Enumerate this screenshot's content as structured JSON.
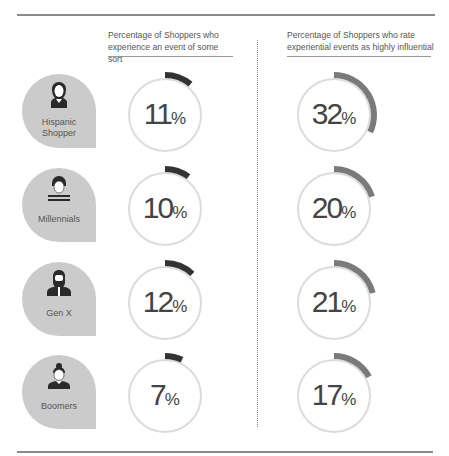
{
  "headers": {
    "left": "Percentage of Shoppers who experience an event of some sort",
    "right": "Percentage of Shoppers who rate experiential events as highly influential"
  },
  "colors": {
    "badge": "#cbcbcb",
    "ring": "#dcdcdc",
    "left_arc": "#333333",
    "right_arc": "#7a7a7a"
  },
  "rows": [
    {
      "label": "Hispanic Shopper",
      "label_line1": "Hispanic",
      "label_line2": "Shopper",
      "icon": "woman-long-hair-icon",
      "experience": "11",
      "influential": "32"
    },
    {
      "label": "Millennials",
      "label_line1": "Millennials",
      "label_line2": "",
      "icon": "young-man-striped-shirt-icon",
      "experience": "10",
      "influential": "20"
    },
    {
      "label": "Gen X",
      "label_line1": "Gen X",
      "label_line2": "",
      "icon": "bearded-man-icon",
      "experience": "12",
      "influential": "21"
    },
    {
      "label": "Boomers",
      "label_line1": "Boomers",
      "label_line2": "",
      "icon": "woman-bun-icon",
      "experience": "7",
      "influential": "17"
    }
  ],
  "percent_sign": "%",
  "chart_data": {
    "type": "table",
    "title": "",
    "categories": [
      "Hispanic Shopper",
      "Millennials",
      "Gen X",
      "Boomers"
    ],
    "series": [
      {
        "name": "Percentage of Shoppers who experience an event of some sort",
        "values": [
          11,
          10,
          12,
          7
        ]
      },
      {
        "name": "Percentage of Shoppers who rate experiential events as highly influential",
        "values": [
          32,
          20,
          21,
          17
        ]
      }
    ],
    "unit": "%",
    "visual": "radial progress gauges (arc starts at 12 o'clock, clockwise)"
  }
}
